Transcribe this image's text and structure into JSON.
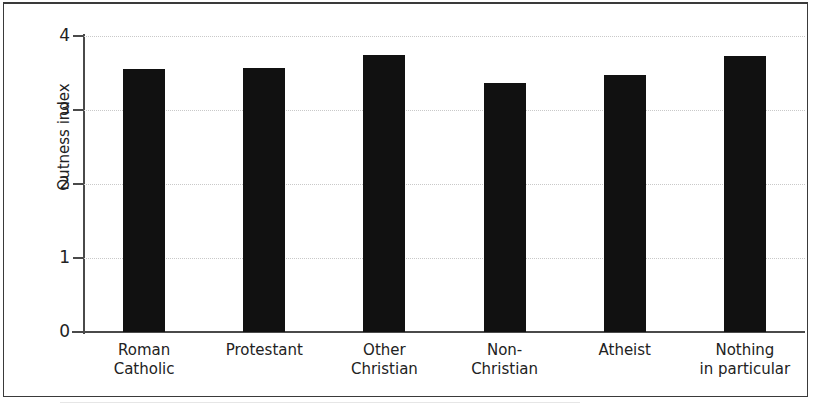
{
  "figure": {
    "background_color": "#ffffff",
    "frame_color": "#3a3a3a",
    "axis_color": "#4a4a4a",
    "bar_color": "#111111",
    "gridline_color": "#c9c9c9"
  },
  "chart_data": {
    "type": "bar",
    "title": "",
    "subtitle": "",
    "xlabel": "",
    "ylabel": "Outness index",
    "categories": [
      "Roman\nCatholic",
      "Protestant",
      "Other\nChristian",
      "Non-\nChristian",
      "Atheist",
      "Nothing\nin particular"
    ],
    "values": [
      3.55,
      3.57,
      3.75,
      3.36,
      3.47,
      3.73
    ],
    "ylim": [
      0,
      4
    ],
    "yticks": [
      0,
      1,
      2,
      3,
      4
    ],
    "ytick_labels": [
      "0",
      "1",
      "2",
      "3",
      "4"
    ],
    "grid": true,
    "grid_axis": "y",
    "legend": false,
    "legend_position": "none",
    "series": [
      {
        "name": "Outness index",
        "values": [
          3.55,
          3.57,
          3.75,
          3.36,
          3.47,
          3.73
        ]
      }
    ]
  }
}
